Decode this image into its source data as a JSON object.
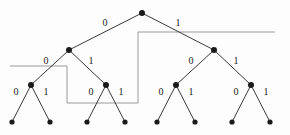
{
  "figure": {
    "width": 290,
    "height": 135,
    "background": "#fdfdfd",
    "edge_color": "#3a3a3a",
    "node_color": "#1a1a1a",
    "region_color": "#9a9a9a",
    "label_color": "#1a1a1a"
  },
  "tree": {
    "depth": 4,
    "root": {
      "id": "root",
      "x": 142,
      "y": 13
    },
    "nodes": [
      {
        "id": "root",
        "x": 142,
        "y": 13,
        "level": 0
      },
      {
        "id": "n0",
        "x": 69,
        "y": 50,
        "level": 1
      },
      {
        "id": "n1",
        "x": 214,
        "y": 50,
        "level": 1
      },
      {
        "id": "n00",
        "x": 31,
        "y": 85,
        "level": 2
      },
      {
        "id": "n01",
        "x": 106,
        "y": 85,
        "level": 2
      },
      {
        "id": "n10",
        "x": 176,
        "y": 85,
        "level": 2
      },
      {
        "id": "n11",
        "x": 251,
        "y": 85,
        "level": 2
      },
      {
        "id": "n000",
        "x": 12,
        "y": 122,
        "level": 3
      },
      {
        "id": "n001",
        "x": 50,
        "y": 122,
        "level": 3
      },
      {
        "id": "n010",
        "x": 87,
        "y": 122,
        "level": 3
      },
      {
        "id": "n011",
        "x": 125,
        "y": 122,
        "level": 3
      },
      {
        "id": "n100",
        "x": 157,
        "y": 122,
        "level": 3
      },
      {
        "id": "n101",
        "x": 195,
        "y": 122,
        "level": 3
      },
      {
        "id": "n110",
        "x": 232,
        "y": 122,
        "level": 3
      },
      {
        "id": "n111",
        "x": 270,
        "y": 122,
        "level": 3
      }
    ],
    "edges": [
      {
        "from": "root",
        "to": "n0",
        "label": "0",
        "label_x": 105,
        "label_y": 23
      },
      {
        "from": "root",
        "to": "n1",
        "label": "1",
        "label_x": 178,
        "label_y": 23
      },
      {
        "from": "n0",
        "to": "n00",
        "label": "0",
        "label_x": 46,
        "label_y": 61
      },
      {
        "from": "n0",
        "to": "n01",
        "label": "1",
        "label_x": 91,
        "label_y": 61
      },
      {
        "from": "n1",
        "to": "n10",
        "label": "0",
        "label_x": 191,
        "label_y": 61
      },
      {
        "from": "n1",
        "to": "n11",
        "label": "1",
        "label_x": 236,
        "label_y": 61
      },
      {
        "from": "n00",
        "to": "n000",
        "label": "0",
        "label_x": 16,
        "label_y": 92
      },
      {
        "from": "n00",
        "to": "n001",
        "label": "1",
        "label_x": 46,
        "label_y": 92
      },
      {
        "from": "n01",
        "to": "n010",
        "label": "0",
        "label_x": 91,
        "label_y": 92
      },
      {
        "from": "n01",
        "to": "n011",
        "label": "1",
        "label_x": 121,
        "label_y": 92
      },
      {
        "from": "n10",
        "to": "n100",
        "label": "0",
        "label_x": 161,
        "label_y": 92
      },
      {
        "from": "n10",
        "to": "n101",
        "label": "1",
        "label_x": 191,
        "label_y": 92
      },
      {
        "from": "n11",
        "to": "n110",
        "label": "0",
        "label_x": 236,
        "label_y": 92
      },
      {
        "from": "n11",
        "to": "n111",
        "label": "1",
        "label_x": 266,
        "label_y": 92
      }
    ],
    "regions": [
      {
        "id": "region-left",
        "name": "left-partition-outline",
        "points": "10,66 67,66 67,103 138,103"
      },
      {
        "id": "region-right",
        "name": "right-partition-outline",
        "points": "138,103 138,32 275,32"
      }
    ]
  }
}
